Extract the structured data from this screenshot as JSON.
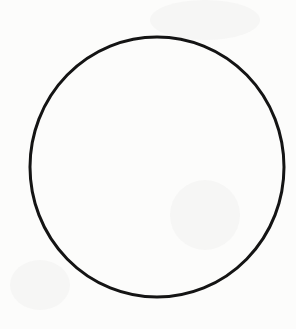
{
  "figure": {
    "shape": "circle",
    "center": [
      157,
      167
    ],
    "radius": 128,
    "stroke_color": "#141414",
    "stroke_width": 3,
    "fill": "none",
    "background_color": "#fcfcfb"
  }
}
